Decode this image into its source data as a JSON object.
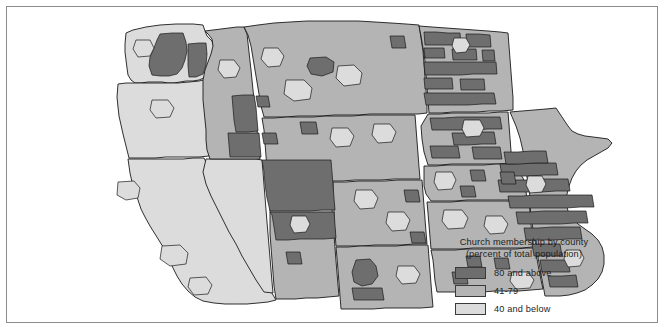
{
  "figure": {
    "type": "choropleth-map",
    "region": "Western and Midwestern United States",
    "border_color": "#8d8d8d",
    "background": "#ffffff"
  },
  "legend": {
    "title_line1": "Church membership by county",
    "title_line2": "(percent of total population)",
    "items": [
      {
        "label": "80 and above",
        "color": "#6e6e6e",
        "class_name": "high"
      },
      {
        "label": "41-79",
        "color": "#b4b4b4",
        "class_name": "medium"
      },
      {
        "label": "40 and below",
        "color": "#dcdcdc",
        "class_name": "low"
      }
    ]
  },
  "map_data": {
    "outline_color": "#1a1a1a",
    "colors": {
      "high": "#6e6e6e",
      "medium": "#b4b4b4",
      "low": "#dcdcdc"
    },
    "states": [
      {
        "name": "Washington",
        "dominant_class": "medium"
      },
      {
        "name": "Oregon",
        "dominant_class": "low"
      },
      {
        "name": "California",
        "dominant_class": "low"
      },
      {
        "name": "Nevada",
        "dominant_class": "low"
      },
      {
        "name": "Idaho",
        "dominant_class": "high"
      },
      {
        "name": "Montana",
        "dominant_class": "medium"
      },
      {
        "name": "Wyoming",
        "dominant_class": "medium"
      },
      {
        "name": "Utah",
        "dominant_class": "high"
      },
      {
        "name": "Arizona",
        "dominant_class": "medium"
      },
      {
        "name": "Colorado",
        "dominant_class": "medium"
      },
      {
        "name": "New Mexico",
        "dominant_class": "medium"
      },
      {
        "name": "North Dakota",
        "dominant_class": "high"
      },
      {
        "name": "South Dakota",
        "dominant_class": "medium"
      },
      {
        "name": "Nebraska",
        "dominant_class": "medium"
      },
      {
        "name": "Kansas",
        "dominant_class": "medium"
      },
      {
        "name": "Oklahoma",
        "dominant_class": "medium"
      },
      {
        "name": "Texas",
        "dominant_class": "medium"
      },
      {
        "name": "Minnesota",
        "dominant_class": "medium"
      },
      {
        "name": "Iowa",
        "dominant_class": "high"
      },
      {
        "name": "Missouri",
        "dominant_class": "medium"
      }
    ]
  }
}
